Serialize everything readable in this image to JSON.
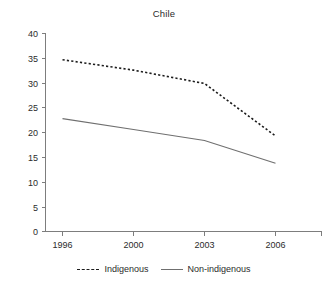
{
  "chart_data": {
    "type": "line",
    "title": "Chile",
    "xlabel": "",
    "ylabel": "",
    "x": [
      "1996",
      "2000",
      "2003",
      "2006"
    ],
    "categories": [
      "1996",
      "2000",
      "2003",
      "2006"
    ],
    "series": [
      {
        "name": "Indigenous",
        "style": "dashed",
        "color": "#1c1c1c",
        "values": [
          34.7,
          32.6,
          29.9,
          19.3
        ]
      },
      {
        "name": "Non-indigenous",
        "style": "solid",
        "color": "#6f6f6f",
        "values": [
          22.8,
          20.6,
          18.4,
          13.8
        ]
      }
    ],
    "ylim": [
      0,
      40
    ],
    "yticks": [
      0,
      5,
      10,
      15,
      20,
      25,
      30,
      35,
      40
    ],
    "ytick_labels": [
      "0",
      "5",
      "10",
      "15",
      "20",
      "25",
      "30",
      "35",
      "40"
    ],
    "xtick_labels": [
      "1996",
      "2000",
      "2003",
      "2006"
    ],
    "grid": false,
    "legend_position": "bottom"
  },
  "axes": {
    "y_tick_0": "0",
    "y_tick_1": "5",
    "y_tick_2": "10",
    "y_tick_3": "15",
    "y_tick_4": "20",
    "y_tick_5": "25",
    "y_tick_6": "30",
    "y_tick_7": "35",
    "y_tick_8": "40",
    "x_tick_0": "1996",
    "x_tick_1": "2000",
    "x_tick_2": "2003",
    "x_tick_3": "2006"
  },
  "legend": {
    "entries": [
      {
        "label": "Indigenous"
      },
      {
        "label": "Non-indigenous"
      }
    ]
  }
}
